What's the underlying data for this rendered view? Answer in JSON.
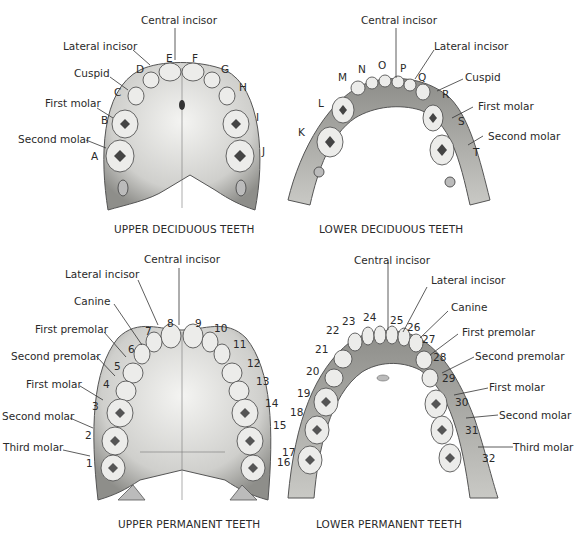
{
  "upper_deciduous": {
    "caption": "UPPER DECIDUOUS TEETH",
    "labels": {
      "central_incisor": "Central incisor",
      "lateral_incisor": "Lateral incisor",
      "cuspid": "Cuspid",
      "first_molar": "First molar",
      "second_molar": "Second molar"
    },
    "letters": [
      "A",
      "B",
      "C",
      "D",
      "E",
      "F",
      "G",
      "H",
      "I",
      "J"
    ]
  },
  "lower_deciduous": {
    "caption": "LOWER DECIDUOUS TEETH",
    "labels": {
      "central_incisor": "Central incisor",
      "lateral_incisor": "Lateral incisor",
      "cuspid": "Cuspid",
      "first_molar": "First molar",
      "second_molar": "Second molar"
    },
    "letters": [
      "K",
      "L",
      "M",
      "N",
      "O",
      "P",
      "Q",
      "R",
      "S",
      "T"
    ]
  },
  "upper_permanent": {
    "caption": "UPPER PERMANENT TEETH",
    "labels": {
      "central_incisor": "Central incisor",
      "lateral_incisor": "Lateral incisor",
      "canine": "Canine",
      "first_premolar": "First premolar",
      "second_premolar": "Second premolar",
      "first_molar": "First molar",
      "second_molar": "Second molar",
      "third_molar": "Third molar"
    },
    "numbers": [
      "1",
      "2",
      "3",
      "4",
      "5",
      "6",
      "7",
      "8",
      "9",
      "10",
      "11",
      "12",
      "13",
      "14",
      "15",
      "16"
    ]
  },
  "lower_permanent": {
    "caption": "LOWER PERMANENT TEETH",
    "labels": {
      "central_incisor": "Central incisor",
      "lateral_incisor": "Lateral incisor",
      "canine": "Canine",
      "first_premolar": "First premolar",
      "second_premolar": "Second premolar",
      "first_molar": "First molar",
      "second_molar": "Second molar",
      "third_molar": "Third molar"
    },
    "numbers": [
      "17",
      "18",
      "19",
      "20",
      "21",
      "22",
      "23",
      "24",
      "25",
      "26",
      "27",
      "28",
      "29",
      "30",
      "31",
      "32"
    ]
  },
  "colors": {
    "bone": "#d9d9d6",
    "bone_shadow": "#9a9a96",
    "tooth": "#ececea",
    "tooth_outline": "#555555",
    "line": "#333333"
  }
}
